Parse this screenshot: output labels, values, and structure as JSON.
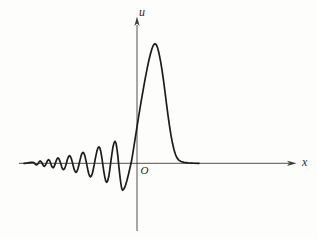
{
  "figure": {
    "background": "#fdfdfb",
    "curve_color": "#1c1c1c",
    "axis_color": "#3c3c3c",
    "labels": {
      "vertical_axis": "u",
      "horizontal_axis": "x",
      "origin": "O"
    }
  },
  "chart_data": {
    "type": "line",
    "title": "",
    "xlabel": "x",
    "ylabel": "u",
    "grid": false,
    "x_ticks": [],
    "y_ticks": [],
    "legend": null,
    "canvas_px": {
      "width": 317,
      "height": 239
    },
    "origin_px": {
      "x": 137,
      "y": 163.3
    },
    "axes_px": {
      "x_start": 19,
      "x_end": 289,
      "x_arrow_tip": 296.5,
      "y_bottom": 231,
      "y_top": 25,
      "y_arrow_tip": 16.5
    },
    "curve": {
      "units": "pixels; x absolute, u relative to origin, positive upward",
      "oscillation_extrema": [
        [
          24,
          0
        ],
        [
          33,
          1
        ],
        [
          36.5,
          -1.6
        ],
        [
          40.3,
          2.3
        ],
        [
          44.3,
          -3
        ],
        [
          48.6,
          3.7
        ],
        [
          53,
          -4.5
        ],
        [
          58,
          5.4
        ],
        [
          63.5,
          -6.4
        ],
        [
          69.5,
          7.6
        ],
        [
          76,
          -9
        ],
        [
          83,
          11
        ],
        [
          90.5,
          -13.5
        ],
        [
          99,
          16.5
        ],
        [
          106.7,
          -19
        ],
        [
          115,
          22
        ],
        [
          122.7,
          -27
        ]
      ],
      "peak_samples": [
        [
          122.7,
          -27
        ],
        [
          124,
          -25.5
        ],
        [
          125.5,
          -22
        ],
        [
          127,
          -17
        ],
        [
          128.5,
          -11
        ],
        [
          130,
          -4.5
        ],
        [
          131.3,
          1
        ],
        [
          132.5,
          8
        ],
        [
          134,
          17.5
        ],
        [
          135.5,
          27
        ],
        [
          137,
          36.5
        ],
        [
          138.5,
          46
        ],
        [
          140,
          55
        ],
        [
          141.5,
          64
        ],
        [
          143,
          72.5
        ],
        [
          144.5,
          81
        ],
        [
          146,
          89
        ],
        [
          147.5,
          96.5
        ],
        [
          149,
          103.5
        ],
        [
          150.5,
          109.5
        ],
        [
          151.8,
          114
        ],
        [
          153,
          117.3
        ],
        [
          154.2,
          119.2
        ],
        [
          155.3,
          119.6
        ],
        [
          156.4,
          118.4
        ],
        [
          157.6,
          115.4
        ],
        [
          159,
          110
        ],
        [
          160.5,
          102.5
        ],
        [
          162,
          93.5
        ],
        [
          163.5,
          83
        ],
        [
          165,
          71.5
        ],
        [
          166.5,
          59.5
        ],
        [
          168,
          48
        ],
        [
          169.5,
          37.5
        ],
        [
          171,
          28
        ],
        [
          172.5,
          20
        ],
        [
          174,
          13.5
        ],
        [
          175.5,
          8.7
        ],
        [
          177,
          5.4
        ],
        [
          178.8,
          3.2
        ],
        [
          181,
          1.8
        ],
        [
          184,
          0.9
        ],
        [
          188,
          0.4
        ],
        [
          193,
          0.15
        ],
        [
          199,
          0
        ]
      ]
    }
  }
}
